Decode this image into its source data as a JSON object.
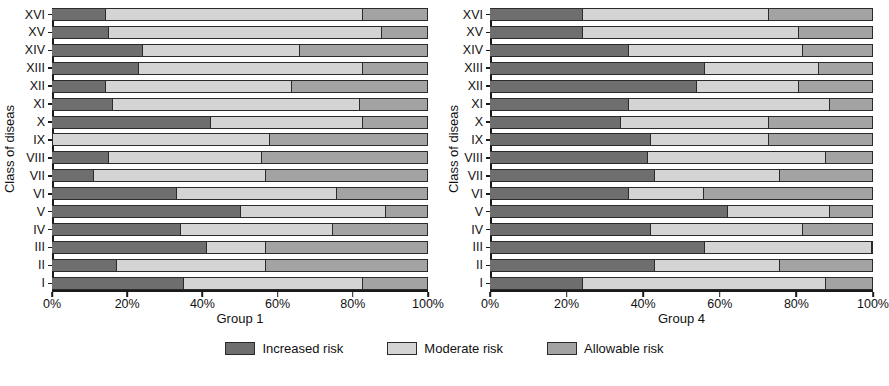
{
  "chart_data": [
    {
      "type": "bar",
      "title": "",
      "xlabel": "Group 1",
      "ylabel": "Class of diseas",
      "orientation": "horizontal",
      "stacked": true,
      "normalized": true,
      "xlim": [
        0,
        100
      ],
      "xticks": [
        0,
        20,
        40,
        60,
        80,
        100
      ],
      "xticklabels": [
        "0%",
        "20%",
        "40%",
        "60%",
        "80%",
        "100%"
      ],
      "grid": false,
      "legend_position": "bottom-center",
      "categories": [
        "I",
        "II",
        "III",
        "IV",
        "V",
        "VI",
        "VII",
        "VIII",
        "IX",
        "X",
        "XI",
        "XII",
        "XIII",
        "XIV",
        "XV",
        "XVI"
      ],
      "series": [
        {
          "name": "Increased risk",
          "color": "#6e6e6e",
          "values": [
            35,
            17,
            41,
            34,
            50,
            33,
            11,
            15,
            0,
            42,
            16,
            14,
            23,
            24,
            15,
            14
          ]
        },
        {
          "name": "Moderate risk",
          "color": "#d4d4d4",
          "values": [
            48,
            40,
            16,
            41,
            39,
            43,
            46,
            41,
            58,
            41,
            66,
            50,
            60,
            42,
            73,
            69
          ]
        },
        {
          "name": "Allowable risk",
          "color": "#a3a3a3",
          "values": [
            17,
            43,
            43,
            25,
            11,
            24,
            43,
            44,
            42,
            17,
            18,
            36,
            17,
            34,
            12,
            17
          ]
        }
      ]
    },
    {
      "type": "bar",
      "title": "",
      "xlabel": "Group 4",
      "ylabel": "Class of diseas",
      "orientation": "horizontal",
      "stacked": true,
      "normalized": true,
      "xlim": [
        0,
        100
      ],
      "xticks": [
        0,
        20,
        40,
        60,
        80,
        100
      ],
      "xticklabels": [
        "0%",
        "20%",
        "40%",
        "60%",
        "80%",
        "100%"
      ],
      "grid": false,
      "legend_position": "bottom-center",
      "categories": [
        "I",
        "II",
        "III",
        "IV",
        "V",
        "VI",
        "VII",
        "VIII",
        "IX",
        "X",
        "XI",
        "XII",
        "XIII",
        "XIV",
        "XV",
        "XVI"
      ],
      "series": [
        {
          "name": "Increased risk",
          "color": "#6e6e6e",
          "values": [
            24,
            43,
            56,
            42,
            62,
            36,
            43,
            41,
            42,
            34,
            36,
            54,
            56,
            36,
            24,
            24
          ]
        },
        {
          "name": "Moderate risk",
          "color": "#d4d4d4",
          "values": [
            64,
            33,
            44,
            40,
            27,
            20,
            33,
            47,
            31,
            39,
            53,
            27,
            30,
            46,
            57,
            49
          ]
        },
        {
          "name": "Allowable risk",
          "color": "#a3a3a3",
          "values": [
            12,
            24,
            0,
            18,
            11,
            44,
            24,
            12,
            27,
            27,
            11,
            19,
            14,
            18,
            19,
            27
          ]
        }
      ]
    }
  ],
  "panels": [
    {
      "id": "group1",
      "ylabel": "Class of diseas",
      "xlabel": "Group 1",
      "xticklabels": [
        "0%",
        "20%",
        "40%",
        "60%",
        "80%",
        "100%"
      ],
      "categories": [
        "I",
        "II",
        "III",
        "IV",
        "V",
        "VI",
        "VII",
        "VIII",
        "IX",
        "X",
        "XI",
        "XII",
        "XIII",
        "XIV",
        "XV",
        "XVI"
      ]
    },
    {
      "id": "group4",
      "ylabel": "Class of diseas",
      "xlabel": "Group 4",
      "xticklabels": [
        "0%",
        "20%",
        "40%",
        "60%",
        "80%",
        "100%"
      ],
      "categories": [
        "I",
        "II",
        "III",
        "IV",
        "V",
        "VI",
        "VII",
        "VIII",
        "IX",
        "X",
        "XI",
        "XII",
        "XIII",
        "XIV",
        "XV",
        "XVI"
      ]
    }
  ],
  "legend": {
    "items": [
      {
        "label": "Increased risk",
        "color": "#6e6e6e",
        "key": "increased"
      },
      {
        "label": "Moderate risk",
        "color": "#d4d4d4",
        "key": "moderate"
      },
      {
        "label": "Allowable risk",
        "color": "#a3a3a3",
        "key": "allowable"
      }
    ]
  }
}
